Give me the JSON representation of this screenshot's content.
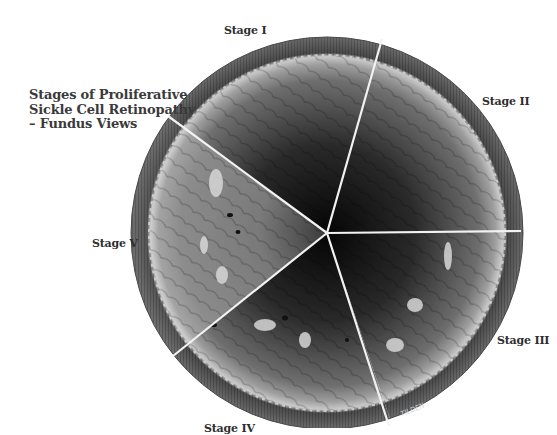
{
  "title": {
    "lines": [
      "Stages of Proliferative",
      "Sickle Cell Retinopathy",
      "– Fundus Views"
    ]
  },
  "illustration": {
    "type": "circular fundus illustration divided into five wedge sectors",
    "center": [
      327,
      233
    ],
    "radius": 196,
    "sectors": [
      {
        "label": "Stage I",
        "position": "top"
      },
      {
        "label": "Stage II",
        "position": "upper-right"
      },
      {
        "label": "Stage III",
        "position": "lower-right"
      },
      {
        "label": "Stage IV",
        "position": "bottom"
      },
      {
        "label": "Stage V",
        "position": "left"
      }
    ],
    "signature": "TILDEN",
    "colors": {
      "rim": "#5a5a5a",
      "periphery": "#9a9a9a",
      "center": "#0a0a0a",
      "divider": "#f2f2f2"
    }
  }
}
